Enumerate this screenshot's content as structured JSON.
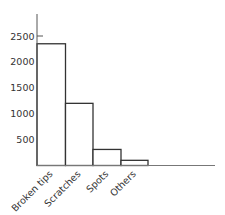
{
  "chart_data": {
    "type": "bar",
    "title": "",
    "xlabel": "",
    "ylabel": "",
    "categories": [
      "Broken tips",
      "Scratches",
      "Spots",
      "Others"
    ],
    "values": [
      2350,
      1200,
      310,
      100
    ],
    "yticks": [
      500,
      1000,
      1500,
      2000,
      2500
    ],
    "ylim": [
      0,
      2800
    ],
    "grid": false,
    "legend": "none",
    "bar_style": "outlined, adjacent (Pareto-style)"
  },
  "colors": {
    "axis": "#555555",
    "bar_stroke": "#333333",
    "bar_fill": "#ffffff",
    "text": "#333333"
  }
}
